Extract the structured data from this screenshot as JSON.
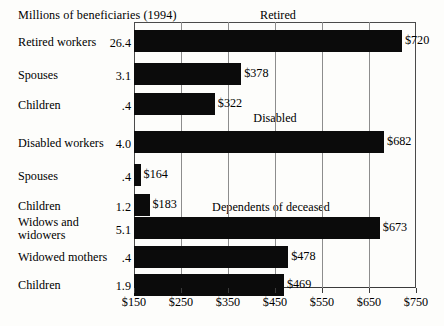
{
  "caption": "Millions of beneficiaries (1994)",
  "chart_data": {
    "type": "bar",
    "orientation": "horizontal",
    "title": "",
    "xlabel": "",
    "ylabel": "",
    "xlim": [
      150,
      750
    ],
    "xticks": [
      150,
      250,
      350,
      450,
      550,
      650,
      750
    ],
    "xtick_labels": [
      "$150",
      "$250",
      "$350",
      "$450",
      "$550",
      "$650",
      "$750"
    ],
    "grid": true,
    "legend": "none",
    "value_prefix": "$",
    "baseline": 150,
    "groups": [
      {
        "name": "Retired",
        "rows": [
          {
            "label": "Retired workers",
            "beneficiaries": "26.4",
            "value": 720,
            "value_label": "$720"
          },
          {
            "label": "Spouses",
            "beneficiaries": "3.1",
            "value": 378,
            "value_label": "$378"
          },
          {
            "label": "Children",
            "beneficiaries": ".4",
            "value": 322,
            "value_label": "$322"
          }
        ]
      },
      {
        "name": "Disabled",
        "rows": [
          {
            "label": "Disabled workers",
            "beneficiaries": "4.0",
            "value": 682,
            "value_label": "$682"
          },
          {
            "label": "Spouses",
            "beneficiaries": ".4",
            "value": 164,
            "value_label": "$164"
          },
          {
            "label": "Children",
            "beneficiaries": "1.2",
            "value": 183,
            "value_label": "$183"
          }
        ]
      },
      {
        "name": "Dependents of deceased",
        "rows": [
          {
            "label": "Widows and\nwidowers",
            "beneficiaries": "5.1",
            "value": 673,
            "value_label": "$673"
          },
          {
            "label": "Widowed mothers",
            "beneficiaries": ".4",
            "value": 478,
            "value_label": "$478"
          },
          {
            "label": "Children",
            "beneficiaries": "1.9",
            "value": 469,
            "value_label": "$469"
          }
        ]
      }
    ]
  }
}
